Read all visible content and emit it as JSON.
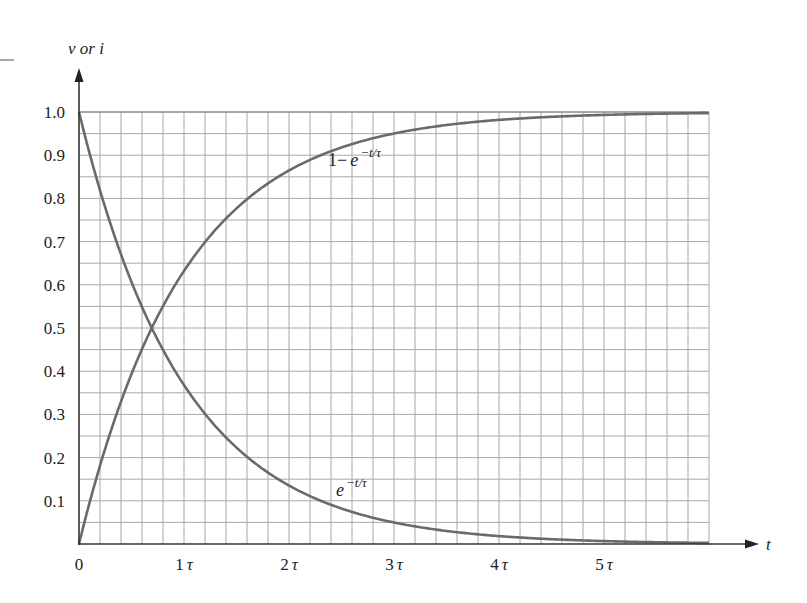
{
  "chart_data": {
    "type": "line",
    "title": "",
    "xlabel": "t",
    "ylabel": "v or i",
    "xlim": [
      0,
      6
    ],
    "ylim": [
      0,
      1.0
    ],
    "grid": true,
    "grid_step_x": 0.2,
    "grid_step_y": 0.05,
    "x_ticks": [
      {
        "value": 0,
        "label": "0"
      },
      {
        "value": 1,
        "label": "1τ"
      },
      {
        "value": 2,
        "label": "2τ"
      },
      {
        "value": 3,
        "label": "3τ"
      },
      {
        "value": 4,
        "label": "4τ"
      },
      {
        "value": 5,
        "label": "5τ"
      }
    ],
    "y_ticks": [
      {
        "value": 0.1,
        "label": "0.1"
      },
      {
        "value": 0.2,
        "label": "0.2"
      },
      {
        "value": 0.3,
        "label": "0.3"
      },
      {
        "value": 0.4,
        "label": "0.4"
      },
      {
        "value": 0.5,
        "label": "0.5"
      },
      {
        "value": 0.6,
        "label": "0.6"
      },
      {
        "value": 0.7,
        "label": "0.7"
      },
      {
        "value": 0.8,
        "label": "0.8"
      },
      {
        "value": 0.9,
        "label": "0.9"
      },
      {
        "value": 1.0,
        "label": "1.0"
      }
    ],
    "x": [
      0,
      0.5,
      1,
      1.5,
      2,
      2.5,
      3,
      3.5,
      4,
      4.5,
      5,
      5.5,
      6
    ],
    "series": [
      {
        "name": "1 − e^(−t/τ)",
        "label_main": "1−",
        "label_base": "e",
        "label_sup": "−t/τ",
        "values": [
          0,
          0.393,
          0.632,
          0.777,
          0.865,
          0.918,
          0.95,
          0.97,
          0.982,
          0.989,
          0.993,
          0.996,
          0.998
        ]
      },
      {
        "name": "e^(−t/τ)",
        "label_main": "",
        "label_base": "e",
        "label_sup": "−t/τ",
        "values": [
          1.0,
          0.607,
          0.368,
          0.223,
          0.135,
          0.082,
          0.05,
          0.03,
          0.018,
          0.011,
          0.007,
          0.004,
          0.002
        ]
      }
    ],
    "annotations": [
      {
        "text": "1 − e^(−t/τ)",
        "x": 2.4,
        "y": 0.88
      },
      {
        "text": "e^(−t/τ)",
        "x": 2.45,
        "y": 0.13
      }
    ],
    "colors": {
      "curve": "#6a6a6a",
      "grid": "#a8a8a8",
      "axis": "#333333"
    }
  }
}
